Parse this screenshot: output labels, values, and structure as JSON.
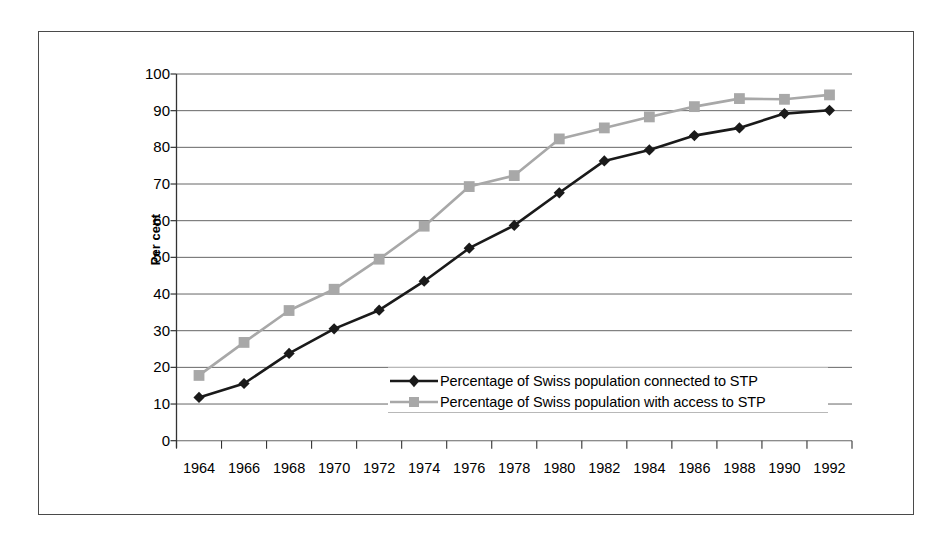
{
  "chart_data": {
    "type": "line",
    "title": "",
    "xlabel": "",
    "ylabel": "Per cent",
    "categories": [
      "1964",
      "1966",
      "1968",
      "1970",
      "1972",
      "1974",
      "1976",
      "1978",
      "1980",
      "1982",
      "1984",
      "1986",
      "1988",
      "1990",
      "1992"
    ],
    "ylim": [
      0,
      100
    ],
    "yticks": [
      "0",
      "10",
      "20",
      "30",
      "40",
      "50",
      "60",
      "70",
      "80",
      "90",
      "100"
    ],
    "grid": true,
    "legend_position": "inside-center",
    "series": [
      {
        "name": "Percentage of Swiss population connected to STP",
        "color": "#1a1a1a",
        "marker": "diamond",
        "values": [
          11.8,
          15.6,
          23.8,
          30.5,
          35.6,
          43.5,
          52.5,
          58.7,
          67.6,
          76.3,
          79.3,
          83.2,
          85.3,
          89.2,
          90.1
        ]
      },
      {
        "name": "Percentage of Swiss population with access to STP",
        "color": "#a8a8a8",
        "marker": "square",
        "values": [
          17.8,
          26.8,
          35.5,
          41.3,
          49.5,
          58.5,
          69.3,
          72.3,
          82.3,
          85.3,
          88.3,
          91.1,
          93.3,
          93.1,
          94.3
        ]
      }
    ]
  },
  "colors": {
    "series_connected": "#1a1a1a",
    "series_access": "#a8a8a8",
    "gridline": "#666666",
    "axis": "#333333",
    "frame": "#4a4a4a",
    "background": "#ffffff"
  }
}
